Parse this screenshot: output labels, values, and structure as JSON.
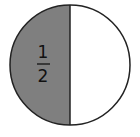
{
  "diagram": {
    "type": "fraction-circle",
    "fraction": {
      "numerator": "1",
      "denominator": "2"
    },
    "shaded_parts": 1,
    "total_parts": 2,
    "colors": {
      "shaded": "#7f7f7f",
      "unshaded": "#ffffff",
      "stroke": "#222222",
      "text": "#111111"
    }
  }
}
